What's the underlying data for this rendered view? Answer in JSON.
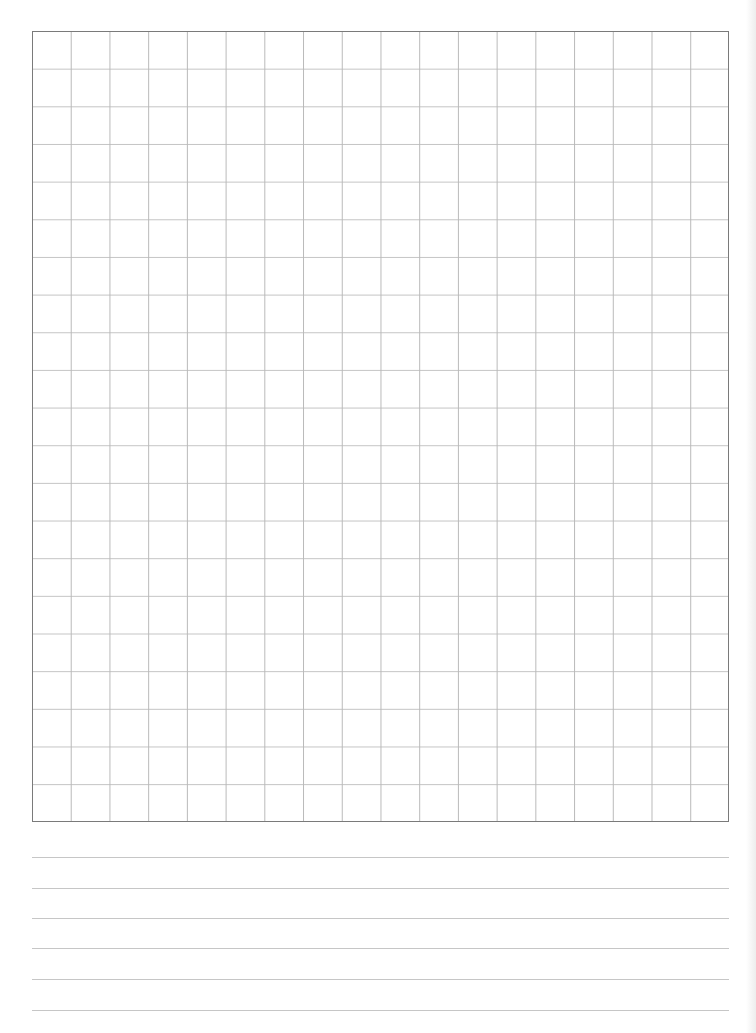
{
  "page": {
    "type": "grid-and-lined-paper",
    "background": "#ffffff"
  },
  "grid": {
    "columns": 18,
    "rows": 21,
    "border_color": "#7a7a7a",
    "line_color": "#c0c0c0"
  },
  "writing_lines": {
    "count": 6,
    "positions_y": [
      857,
      888,
      918,
      948,
      979,
      1010
    ],
    "color": "#c6c6c6"
  }
}
